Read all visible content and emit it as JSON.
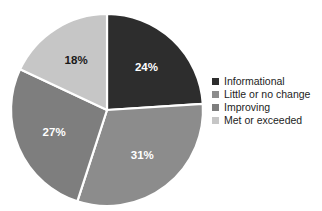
{
  "chart_data": {
    "type": "pie",
    "title": "",
    "subtitle": "",
    "xlabel": "",
    "ylabel": "",
    "legend_position": "right",
    "grid": false,
    "start_angle_deg": 0,
    "direction": "clockwise",
    "categories": [
      "Informational",
      "Little or no change",
      "Improving",
      "Met or exceeded"
    ],
    "values": [
      24,
      31,
      27,
      18
    ],
    "value_unit": "%",
    "data_labels": [
      "24%",
      "31%",
      "27%",
      "18%"
    ],
    "colors": [
      "#2d2d2d",
      "#8c8c8c",
      "#7e7e7e",
      "#c6c6c6"
    ],
    "label_colors": [
      "#ffffff",
      "#ffffff",
      "#ffffff",
      "#1a1a1a"
    ],
    "slices": [
      {
        "label": "Informational",
        "value": 24,
        "display": "24%",
        "color": "#2d2d2d",
        "label_color": "#ffffff"
      },
      {
        "label": "Little or no change",
        "value": 31,
        "display": "31%",
        "color": "#8c8c8c",
        "label_color": "#ffffff"
      },
      {
        "label": "Improving",
        "value": 27,
        "display": "27%",
        "color": "#7e7e7e",
        "label_color": "#ffffff"
      },
      {
        "label": "Met or exceeded",
        "value": 18,
        "display": "18%",
        "color": "#c6c6c6",
        "label_color": "#1a1a1a"
      }
    ]
  },
  "pie": {
    "center_x": 107,
    "center_y": 110,
    "radius": 96,
    "separator_color": "#ffffff"
  },
  "legend": {
    "items": [
      {
        "label": "Informational",
        "color": "#2d2d2d"
      },
      {
        "label": "Little or no change",
        "color": "#8c8c8c"
      },
      {
        "label": "Improving",
        "color": "#7e7e7e"
      },
      {
        "label": "Met or exceeded",
        "color": "#c6c6c6"
      }
    ]
  }
}
